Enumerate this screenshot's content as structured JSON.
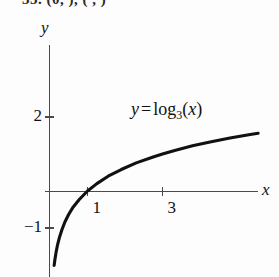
{
  "page": {
    "exercise_line": "33. (0,   ), (    ,    )"
  },
  "chart_data": {
    "type": "line",
    "title": "",
    "annotation": "y = log₃(x)",
    "equation_parts": {
      "lhs": "y",
      "operator": "=",
      "func": "log",
      "base": "3",
      "arg_open": "(",
      "arg": "x",
      "arg_close": ")"
    },
    "xlabel": "x",
    "ylabel": "y",
    "xlim": [
      -0.14,
      5.55
    ],
    "ylim": [
      -2.3,
      3.95
    ],
    "grid": false,
    "legend": null,
    "xticks": [
      1,
      3
    ],
    "xtick_labels": [
      "1",
      "3"
    ],
    "yticks": [
      2,
      -1
    ],
    "ytick_labels": [
      "2",
      "−1"
    ],
    "series": [
      {
        "name": "y = log3(x)",
        "color": "#111111",
        "x": [
          0.11,
          0.13,
          0.16,
          0.2,
          0.25,
          0.32,
          0.4,
          0.5,
          0.62,
          0.78,
          1.0,
          1.25,
          1.55,
          1.9,
          2.3,
          2.75,
          3.0,
          3.3,
          3.8,
          4.3,
          4.8,
          5.3,
          5.55
        ],
        "y": [
          -2.01,
          -1.86,
          -1.67,
          -1.46,
          -1.26,
          -1.04,
          -0.83,
          -0.63,
          -0.43,
          -0.23,
          0.0,
          0.2,
          0.4,
          0.58,
          0.76,
          0.92,
          1.0,
          1.09,
          1.22,
          1.33,
          1.43,
          1.52,
          1.56
        ]
      }
    ]
  },
  "axes_geometry": {
    "origin_px": [
      50,
      191
    ],
    "x_unit_px": 37.5,
    "y_unit_px": 37.0
  }
}
